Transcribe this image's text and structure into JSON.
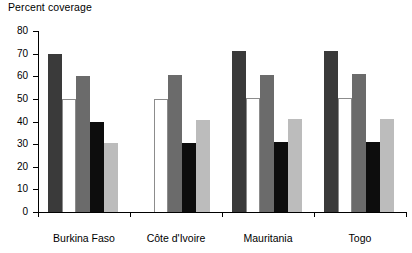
{
  "chart_data": {
    "type": "bar",
    "title": "Percent coverage",
    "xlabel": "",
    "ylabel": "Percent coverage",
    "ylim": [
      0,
      80
    ],
    "ytick_labels": [
      "0",
      "10",
      "20",
      "30",
      "40",
      "50",
      "60",
      "70",
      "80"
    ],
    "yticks": [
      0,
      10,
      20,
      30,
      40,
      50,
      60,
      70,
      80
    ],
    "grid": false,
    "legend": "none",
    "categories": [
      "Burkina Faso",
      "Côte d'Ivoire",
      "Mauritania",
      "Togo"
    ],
    "series": [
      {
        "name": "series-1",
        "color": "#3a3a3a",
        "values": [
          70,
          null,
          71,
          71
        ]
      },
      {
        "name": "series-2",
        "color": "#ffffff",
        "values": [
          50,
          50,
          50.5,
          50.5
        ]
      },
      {
        "name": "series-3",
        "color": "#6b6b6b",
        "values": [
          60,
          60.5,
          60.5,
          61
        ]
      },
      {
        "name": "series-4",
        "color": "#0d0d0d",
        "values": [
          40,
          30.5,
          31,
          31
        ]
      },
      {
        "name": "series-5",
        "color": "#bcbcbc",
        "values": [
          30.5,
          40.5,
          41,
          41
        ]
      }
    ]
  }
}
